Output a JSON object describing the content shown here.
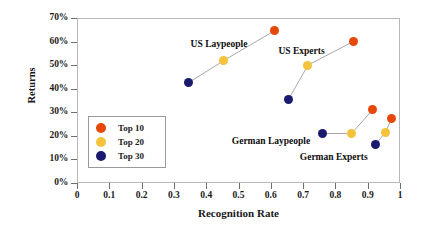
{
  "chart_data": {
    "type": "scatter",
    "title": "",
    "xlabel": "Recognition Rate",
    "ylabel": "Returns",
    "xlim": [
      0,
      1
    ],
    "ylim": [
      0,
      0.7
    ],
    "grid": false,
    "legend_position": "inner-left",
    "x_ticks": [
      "0",
      "0.1",
      "0.2",
      "0.3",
      "0.4",
      "0.5",
      "0.6",
      "0.7",
      "0.8",
      "0.9",
      "1"
    ],
    "x_tick_values": [
      0,
      0.1,
      0.2,
      0.3,
      0.4,
      0.5,
      0.6,
      0.7,
      0.8,
      0.9,
      1
    ],
    "y_ticks": [
      "0%",
      "10%",
      "20%",
      "30%",
      "40%",
      "50%",
      "60%",
      "70%"
    ],
    "y_tick_values": [
      0,
      0.1,
      0.2,
      0.3,
      0.4,
      0.5,
      0.6,
      0.7
    ],
    "legend": [
      {
        "name": "Top 10",
        "color": "#E8470A"
      },
      {
        "name": "Top 20",
        "color": "#F5C23C"
      },
      {
        "name": "Top 30",
        "color": "#1A1A6E"
      }
    ],
    "annotations": [
      {
        "text": "US Laypeople",
        "x": 0.44,
        "y": 0.585
      },
      {
        "text": "US Experts",
        "x": 0.695,
        "y": 0.555
      },
      {
        "text": "German Laypeople",
        "x": 0.6,
        "y": 0.175
      },
      {
        "text": "German Experts",
        "x": 0.795,
        "y": 0.105
      }
    ],
    "groups": [
      {
        "name": "US Laypeople",
        "points": [
          {
            "series": "Top 30",
            "x": 0.345,
            "y": 0.425,
            "color": "#1A1A6E"
          },
          {
            "series": "Top 20",
            "x": 0.455,
            "y": 0.52,
            "color": "#F5C23C"
          },
          {
            "series": "Top 10",
            "x": 0.61,
            "y": 0.645,
            "color": "#E8470A"
          }
        ]
      },
      {
        "name": "US Experts",
        "points": [
          {
            "series": "Top 30",
            "x": 0.655,
            "y": 0.355,
            "color": "#1A1A6E"
          },
          {
            "series": "Top 20",
            "x": 0.715,
            "y": 0.5,
            "color": "#F5C23C"
          },
          {
            "series": "Top 10",
            "x": 0.855,
            "y": 0.6,
            "color": "#E8470A"
          }
        ]
      },
      {
        "name": "German Laypeople",
        "points": [
          {
            "series": "Top 30",
            "x": 0.76,
            "y": 0.21,
            "color": "#1A1A6E"
          },
          {
            "series": "Top 20",
            "x": 0.85,
            "y": 0.21,
            "color": "#F5C23C"
          },
          {
            "series": "Top 10",
            "x": 0.915,
            "y": 0.31,
            "color": "#E8470A"
          }
        ]
      },
      {
        "name": "German Experts",
        "points": [
          {
            "series": "Top 30",
            "x": 0.925,
            "y": 0.165,
            "color": "#1A1A6E"
          },
          {
            "series": "Top 20",
            "x": 0.955,
            "y": 0.215,
            "color": "#F5C23C"
          },
          {
            "series": "Top 10",
            "x": 0.975,
            "y": 0.275,
            "color": "#E8470A"
          }
        ]
      }
    ]
  }
}
